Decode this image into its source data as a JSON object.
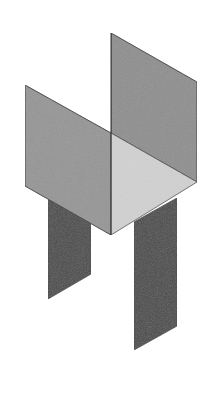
{
  "figure": {
    "colors": {
      "background": "#ffffff",
      "side_panel": "#8e8e8e",
      "floor": "#cfcfcf",
      "front_left_face": "#9a9a9a",
      "legs": "#4a4a4a",
      "edge": "#3a3a3a"
    },
    "shapes": {
      "back_right_panel": "111,33 197,82 197,182 111,133",
      "left_panel": "25,85 111,133 111,235 25,186",
      "floor": "111,133 197,182 111,235",
      "left_leg": "48,198 91,222 91,274 48,299",
      "right_leg": "134,222 177,198 177,326 134,350"
    }
  }
}
